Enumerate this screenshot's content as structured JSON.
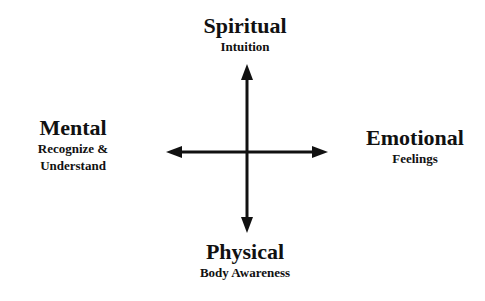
{
  "diagram": {
    "type": "four-direction cross diagram",
    "center": "",
    "nodes": {
      "top": {
        "title": "Spiritual",
        "subtitle": "Intuition"
      },
      "left": {
        "title": "Mental",
        "subtitle_line1": "Recognize &",
        "subtitle_line2": "Understand"
      },
      "right": {
        "title": "Emotional",
        "subtitle": "Feelings"
      },
      "bottom": {
        "title": "Physical",
        "subtitle": "Body Awareness"
      }
    },
    "arrows": [
      "up",
      "down",
      "left",
      "right"
    ],
    "colors": {
      "line": "#111111",
      "background": "#ffffff"
    }
  }
}
